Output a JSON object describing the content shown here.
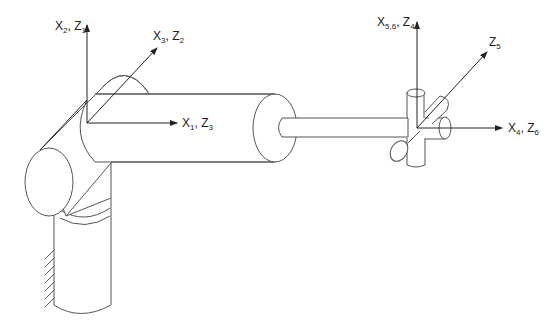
{
  "diagram": {
    "axis_labels": {
      "x2_z1": {
        "main": [
          "X",
          "2",
          ", Z",
          "1"
        ]
      },
      "x3_z2": {
        "main": [
          "X",
          "3",
          ", Z",
          "2"
        ]
      },
      "x1_z3": {
        "main": [
          "X",
          "1",
          ", Z",
          "3"
        ]
      },
      "x56_z4": {
        "main": [
          "X",
          "5,6",
          ", Z",
          "4"
        ]
      },
      "z5": {
        "main": [
          "Z",
          "5"
        ]
      },
      "x4_z6": {
        "main": [
          "X",
          "4",
          ", Z",
          "6"
        ]
      }
    },
    "colors": {
      "line": "#555555",
      "axis": "#222222",
      "background": "#ffffff"
    }
  }
}
